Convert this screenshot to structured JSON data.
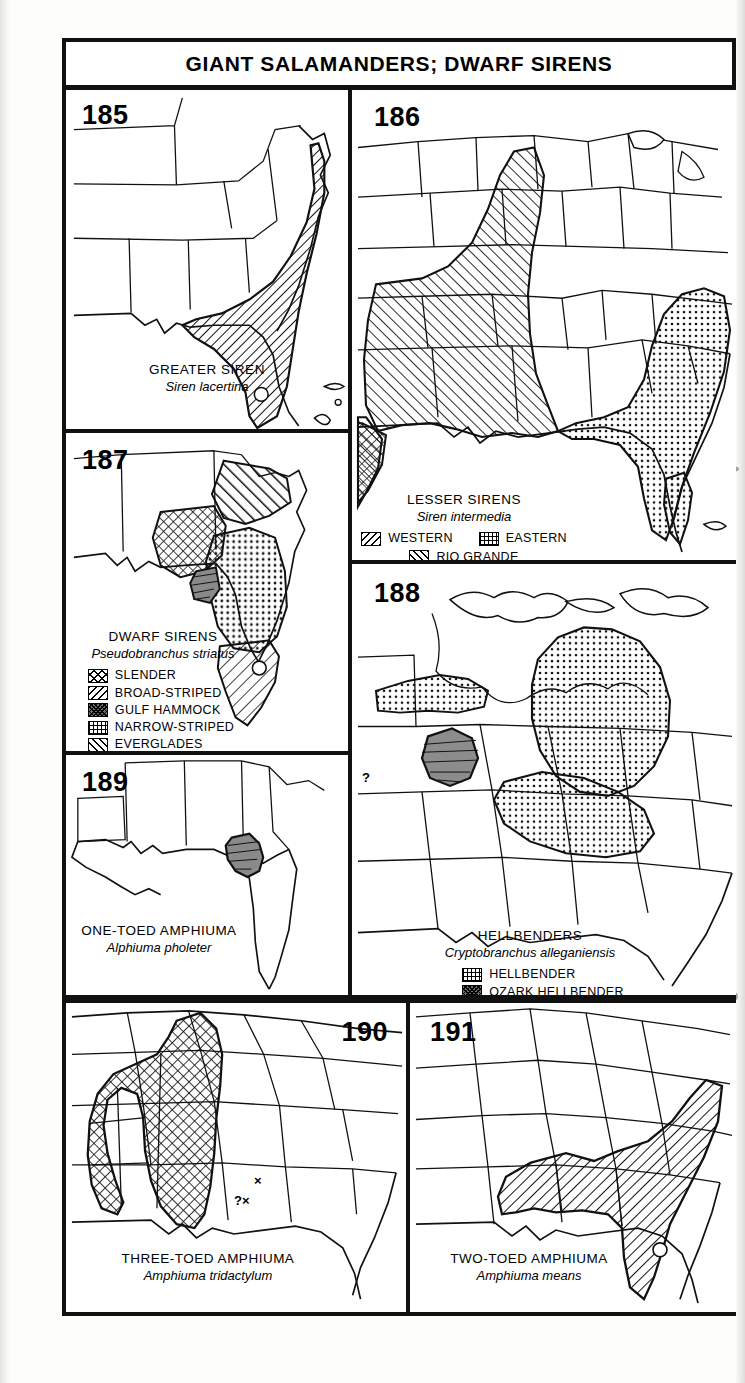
{
  "page": {
    "title": "GIANT SALAMANDERS; DWARF SIRENS"
  },
  "panels": [
    {
      "number": "185",
      "common_name": "GREATER SIREN",
      "scientific_name": "Siren lacertina",
      "legend": [],
      "markers": []
    },
    {
      "number": "186",
      "common_name": "LESSER SIRENS",
      "scientific_name": "Siren intermedia",
      "legend": [
        {
          "label": "WESTERN",
          "pattern": "bslash"
        },
        {
          "label": "EASTERN",
          "pattern": "dots"
        },
        {
          "label": "RIO GRANDE",
          "pattern": "fslash"
        }
      ],
      "markers": []
    },
    {
      "number": "187",
      "common_name": "DWARF SIRENS",
      "scientific_name": "Pseudobranchus striatus",
      "legend": [
        {
          "label": "SLENDER",
          "pattern": "cross"
        },
        {
          "label": "BROAD-STRIPED",
          "pattern": "bslash"
        },
        {
          "label": "GULF HAMMOCK",
          "pattern": "dark"
        },
        {
          "label": "NARROW-STRIPED",
          "pattern": "grid"
        },
        {
          "label": "EVERGLADES",
          "pattern": "fslash"
        }
      ],
      "markers": []
    },
    {
      "number": "188",
      "common_name": "HELLBENDERS",
      "scientific_name": "Cryptobranchus alleganiensis",
      "legend": [
        {
          "label": "HELLBENDER",
          "pattern": "dots"
        },
        {
          "label": "OZARK HELLBENDER",
          "pattern": "dark"
        }
      ],
      "markers": [
        {
          "text": "?"
        }
      ]
    },
    {
      "number": "189",
      "common_name": "ONE-TOED AMPHIUMA",
      "scientific_name": "Alphiuma pholeter",
      "legend": [],
      "markers": []
    },
    {
      "number": "190",
      "common_name": "THREE-TOED AMPHIUMA",
      "scientific_name": "Amphiuma tridactylum",
      "legend": [],
      "markers": [
        {
          "text": "×"
        },
        {
          "text": "?×"
        }
      ]
    },
    {
      "number": "191",
      "common_name": "TWO-TOED AMPHIUMA",
      "scientific_name": "Amphiuma means",
      "legend": [],
      "markers": []
    }
  ],
  "colors": {
    "ink": "#111111",
    "paper": "#fdfdfb",
    "shade_gray": "#6e6e6e"
  }
}
